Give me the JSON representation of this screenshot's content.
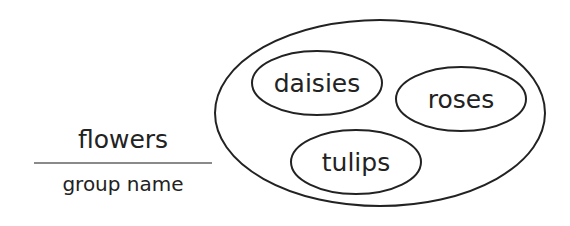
{
  "group": {
    "name": "flowers",
    "caption": "group name",
    "divider_color": "#8a8a8a"
  },
  "set": {
    "stroke_color": "#222222",
    "members": [
      {
        "label": "daisies"
      },
      {
        "label": "roses"
      },
      {
        "label": "tulips"
      }
    ]
  }
}
